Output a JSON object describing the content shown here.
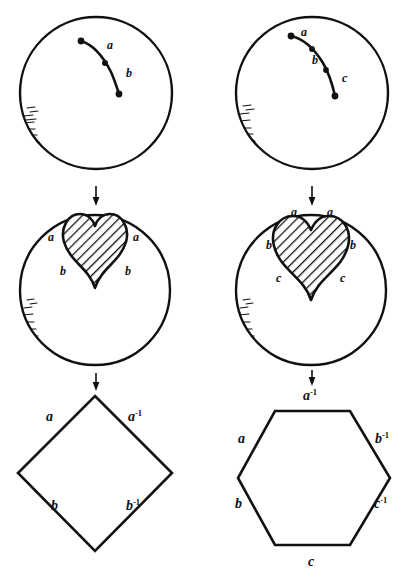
{
  "figure": {
    "ink_color": "#111111",
    "background_color": "#ffffff",
    "columns": [
      {
        "name": "two-segment",
        "segment_count": 2,
        "polygon": "square",
        "polygon_sides": 4
      },
      {
        "name": "three-segment",
        "segment_count": 3,
        "polygon": "hexagon",
        "polygon_sides": 6
      }
    ]
  },
  "row_top": {
    "left": {
      "arc_labels": [
        "a",
        "b"
      ],
      "node_count": 3
    },
    "right": {
      "arc_labels": [
        "a",
        "b",
        "c"
      ],
      "node_count": 4
    }
  },
  "row_middle": {
    "left": {
      "left_labels": [
        "a",
        "b"
      ],
      "right_labels": [
        "a",
        "b"
      ]
    },
    "right": {
      "left_labels": [
        "a",
        "b",
        "c"
      ],
      "right_labels": [
        "a",
        "b",
        "c"
      ]
    }
  },
  "row_bottom": {
    "left": {
      "shape": "square",
      "edges": [
        {
          "label": "a",
          "exponent": "",
          "position": "upper-left"
        },
        {
          "label": "a",
          "exponent": "-1",
          "position": "upper-right"
        },
        {
          "label": "b",
          "exponent": "",
          "position": "lower-left"
        },
        {
          "label": "b",
          "exponent": "-1",
          "position": "lower-right"
        }
      ]
    },
    "right": {
      "shape": "hexagon",
      "edges": [
        {
          "label": "a",
          "exponent": "-1",
          "position": "top"
        },
        {
          "label": "a",
          "exponent": "",
          "position": "upper-left"
        },
        {
          "label": "b",
          "exponent": "-1",
          "position": "upper-right"
        },
        {
          "label": "b",
          "exponent": "",
          "position": "lower-left"
        },
        {
          "label": "c",
          "exponent": "-1",
          "position": "lower-right"
        },
        {
          "label": "c",
          "exponent": "",
          "position": "bottom"
        }
      ]
    }
  },
  "arrows": {
    "glyph": "downward-arrow",
    "count": 4,
    "direction": "down"
  }
}
